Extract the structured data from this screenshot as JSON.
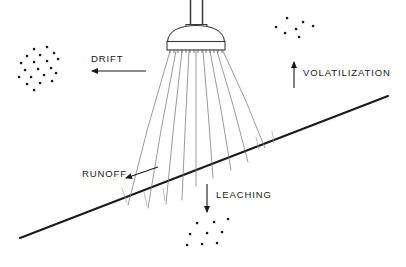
{
  "diagram": {
    "title": "Pesticide Spray Application Pathways",
    "type": "schematic-illustration",
    "background_color": "#ffffff",
    "ink_color": "#1a1a1a",
    "spray_line_color": "#7a7a7a",
    "width": 406,
    "height": 267
  },
  "labels": {
    "drift": "DRIFT",
    "volatilization": "VOLATILIZATION",
    "runoff": "RUNOFF",
    "leaching": "LEACHING"
  },
  "label_positions": {
    "drift": {
      "x": 88,
      "y": 62
    },
    "volatilization": {
      "x": 303,
      "y": 75
    },
    "runoff": {
      "x": 82,
      "y": 177
    },
    "leaching": {
      "x": 216,
      "y": 198
    }
  },
  "arrows": {
    "drift": {
      "name": "drift-arrow",
      "direction": "left",
      "x1": 146,
      "y1": 71,
      "x2": 90,
      "y2": 71
    },
    "volatilization": {
      "name": "volatilization-arrow",
      "direction": "up",
      "x1": 294,
      "y1": 86,
      "x2": 294,
      "y2": 62
    },
    "runoff": {
      "name": "runoff-arrow",
      "direction": "down-left",
      "x1": 155,
      "y1": 168,
      "x2": 123,
      "y2": 179
    },
    "leaching": {
      "name": "leaching-arrow",
      "direction": "down",
      "x1": 207,
      "y1": 184,
      "x2": 207,
      "y2": 212
    }
  },
  "ground_line": {
    "name": "soil-surface-line",
    "x1": 20,
    "y1": 238,
    "x2": 388,
    "y2": 96,
    "stroke_width": 2.1
  },
  "sprayer": {
    "name": "boom-sprayer-head",
    "pipe_left": {
      "x": 190,
      "y_top": 0,
      "y_bottom": 24
    },
    "pipe_right": {
      "x": 202,
      "y_top": 0,
      "y_bottom": 24
    },
    "collar": {
      "x": 186,
      "y": 24,
      "width": 20,
      "height": 6
    },
    "dome": {
      "cx": 196,
      "cy": 40,
      "rx": 29,
      "ry": 11
    },
    "manifold": {
      "x": 167,
      "y": 40,
      "width": 58,
      "height": 9
    },
    "nozzle_count": 14,
    "spray_stream_count": 9
  },
  "spray_streams": [
    {
      "x1": 170,
      "y1": 51,
      "x2": 128,
      "y2": 205
    },
    {
      "x1": 176,
      "y1": 51,
      "x2": 148,
      "y2": 208
    },
    {
      "x1": 182,
      "y1": 51,
      "x2": 166,
      "y2": 204
    },
    {
      "x1": 189,
      "y1": 51,
      "x2": 182,
      "y2": 200
    },
    {
      "x1": 196,
      "y1": 51,
      "x2": 196,
      "y2": 186
    },
    {
      "x1": 203,
      "y1": 51,
      "x2": 213,
      "y2": 178
    },
    {
      "x1": 210,
      "y1": 51,
      "x2": 231,
      "y2": 170
    },
    {
      "x1": 217,
      "y1": 51,
      "x2": 248,
      "y2": 162
    },
    {
      "x1": 223,
      "y1": 51,
      "x2": 265,
      "y2": 148
    }
  ],
  "spray_tips": [
    {
      "x1": 122,
      "y1": 188,
      "x2": 127,
      "y2": 203
    },
    {
      "x1": 144,
      "y1": 192,
      "x2": 147,
      "y2": 206
    },
    {
      "x1": 163,
      "y1": 188,
      "x2": 165,
      "y2": 201
    },
    {
      "x1": 256,
      "y1": 137,
      "x2": 259,
      "y2": 150
    },
    {
      "x1": 272,
      "y1": 131,
      "x2": 274,
      "y2": 143
    }
  ],
  "particle_clusters": [
    {
      "name": "drift-particle-cloud",
      "dots": [
        {
          "x": 34,
          "y": 49
        },
        {
          "x": 47,
          "y": 47
        },
        {
          "x": 27,
          "y": 56
        },
        {
          "x": 40,
          "y": 55
        },
        {
          "x": 54,
          "y": 53
        },
        {
          "x": 21,
          "y": 63
        },
        {
          "x": 34,
          "y": 62
        },
        {
          "x": 47,
          "y": 61
        },
        {
          "x": 58,
          "y": 59
        },
        {
          "x": 25,
          "y": 70
        },
        {
          "x": 38,
          "y": 69
        },
        {
          "x": 51,
          "y": 68
        },
        {
          "x": 19,
          "y": 77
        },
        {
          "x": 31,
          "y": 77
        },
        {
          "x": 44,
          "y": 75
        },
        {
          "x": 56,
          "y": 73
        },
        {
          "x": 27,
          "y": 84
        },
        {
          "x": 40,
          "y": 83
        },
        {
          "x": 52,
          "y": 81
        },
        {
          "x": 34,
          "y": 90
        }
      ]
    },
    {
      "name": "volatilization-particle-cloud",
      "dots": [
        {
          "x": 287,
          "y": 18
        },
        {
          "x": 303,
          "y": 22
        },
        {
          "x": 296,
          "y": 29
        },
        {
          "x": 313,
          "y": 26
        },
        {
          "x": 285,
          "y": 33
        },
        {
          "x": 299,
          "y": 37
        },
        {
          "x": 276,
          "y": 27
        }
      ]
    },
    {
      "name": "leaching-particle-cloud",
      "dots": [
        {
          "x": 228,
          "y": 219
        },
        {
          "x": 197,
          "y": 223
        },
        {
          "x": 214,
          "y": 222
        },
        {
          "x": 190,
          "y": 234
        },
        {
          "x": 207,
          "y": 233
        },
        {
          "x": 222,
          "y": 232
        },
        {
          "x": 187,
          "y": 245
        },
        {
          "x": 202,
          "y": 244
        },
        {
          "x": 217,
          "y": 243
        }
      ]
    }
  ]
}
